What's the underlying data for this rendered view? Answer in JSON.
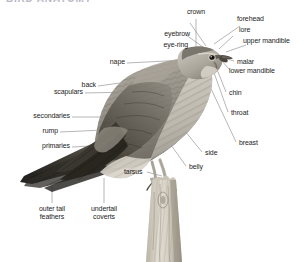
{
  "figure": {
    "title": "BIRD ANATOMY",
    "caption_visible": false,
    "background_color": "#ffffff",
    "label_color": "#1d1d1d",
    "leader_line_color": "#7b7b7b",
    "subject_orientation": "facing right",
    "perch": "wooden post"
  },
  "labels": {
    "crown": "crown",
    "forehead": "forehead",
    "lore": "lore",
    "upper_mandible": "upper mandible",
    "eyebrow": "eyebrow",
    "eye_ring": "eye-ring",
    "malar": "malar",
    "lower_mandible": "lower mandible",
    "chin": "chin",
    "throat": "throat",
    "breast": "breast",
    "side": "side",
    "belly": "belly",
    "nape": "nape",
    "back": "back",
    "scapulars": "scapulars",
    "secondaries": "secondaries",
    "rump": "rump",
    "primaries": "primaries",
    "tarsus": "tarsus",
    "outer_tail_feathers_line1": "outer tail",
    "outer_tail_feathers_line2": "feathers",
    "undertail_coverts_line1": "undertail",
    "undertail_coverts_line2": "coverts"
  },
  "colors": {
    "plumage_light": "#c6c2ba",
    "plumage_mid": "#9a958c",
    "plumage_dark": "#5d594f",
    "plumage_darkest": "#332f2a",
    "breast_pale": "#ded9d0",
    "perch_light": "#e2ddd3",
    "perch_shadow": "#aba596",
    "eye": "#17150f"
  }
}
